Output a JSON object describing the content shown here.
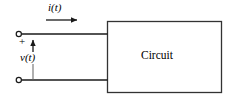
{
  "figure": {
    "name": "two-terminal-circuit-port-diagram",
    "width": 231,
    "height": 99,
    "background_color": "#ffffff",
    "line_color": "#1a1a1a",
    "text_color": "#000000"
  },
  "block": {
    "label": "Circuit",
    "x": 107,
    "y": 21,
    "width": 115,
    "height": 72,
    "border_color": "#333333",
    "fill_color": "#ffffff"
  },
  "labels": {
    "current": "i(t)",
    "voltage": "v(t)",
    "polarity_plus": "+"
  },
  "terminals": [
    {
      "name": "top-terminal",
      "x": 19,
      "y": 34,
      "radius": 2.6
    },
    {
      "name": "bottom-terminal",
      "x": 19,
      "y": 80,
      "radius": 2.6
    }
  ],
  "wires": [
    {
      "name": "top-lead",
      "x1": 21,
      "y1": 34,
      "x2": 107,
      "y2": 34
    },
    {
      "name": "bottom-lead",
      "x1": 21,
      "y1": 80,
      "x2": 107,
      "y2": 80
    }
  ],
  "arrows": {
    "current": {
      "name": "current-direction-arrow",
      "direction": "right",
      "x1": 46,
      "y1": 20,
      "x2": 80,
      "y2": 20
    },
    "voltage": {
      "name": "voltage-polarity-arrow",
      "direction": "up",
      "x1": 33,
      "y1": 80,
      "x2": 33,
      "y2": 37
    }
  }
}
